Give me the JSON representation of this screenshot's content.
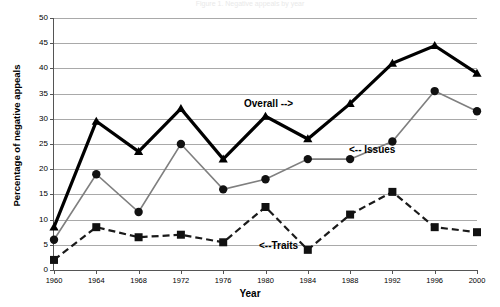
{
  "figure": {
    "cut_title": "Figure 1. Negative appeals by year"
  },
  "axes": {
    "ylabel": "Percentage of negative appeals",
    "xlabel": "Year",
    "yticks": [
      "0",
      "5",
      "10",
      "15",
      "20",
      "25",
      "30",
      "35",
      "40",
      "45",
      "50"
    ],
    "xticks": [
      "1960",
      "1964",
      "1968",
      "1972",
      "1976",
      "1980",
      "1984",
      "1988",
      "1992",
      "1996",
      "2000"
    ]
  },
  "annotations": {
    "overall": "Overall -->",
    "issues": "<-- Issues",
    "traits": "<--Traits"
  },
  "colors": {
    "overall": "#000000",
    "issues": "#7f7f7f",
    "traits": "#1a1a1a",
    "grid": "#a9a9a9",
    "axis": "#555555"
  },
  "chart_data": {
    "type": "line",
    "title": "",
    "xlabel": "Year",
    "ylabel": "Percentage of negative appeals",
    "xlim": [
      1960,
      2000
    ],
    "ylim": [
      0,
      50
    ],
    "grid": true,
    "legend": "inline-annotations",
    "x": [
      1960,
      1964,
      1968,
      1972,
      1976,
      1980,
      1984,
      1988,
      1992,
      1996,
      2000
    ],
    "series": [
      {
        "name": "Overall",
        "marker": "triangle",
        "style": "solid-thick",
        "color": "#000000",
        "values": [
          8.5,
          29.5,
          23.5,
          32,
          22,
          30.5,
          26,
          33,
          41,
          44.5,
          39
        ]
      },
      {
        "name": "Issues",
        "marker": "circle",
        "style": "solid-thin",
        "color": "#7f7f7f",
        "values": [
          6,
          19,
          11.5,
          25,
          16,
          18,
          22,
          22,
          25.5,
          35.5,
          31.5
        ]
      },
      {
        "name": "Traits",
        "marker": "square",
        "style": "dashed",
        "color": "#1a1a1a",
        "values": [
          2,
          8.5,
          6.5,
          7,
          5.5,
          12.5,
          4,
          11,
          15.5,
          8.5,
          7.5
        ]
      }
    ]
  }
}
